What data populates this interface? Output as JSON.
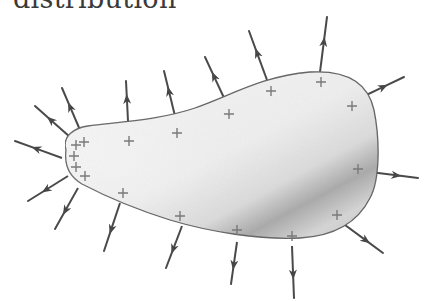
{
  "caption": {
    "text": "distribution"
  },
  "figure": {
    "colors": {
      "outline": "#555555",
      "arrow": "#4a4a4a",
      "plus": "#7a7a7a",
      "fill_light": "#f4f4f4",
      "fill_dark": "#9a9a9a"
    },
    "blob_path": "M 66 150 C 62 136, 74 128, 88 126 C 118 122, 160 120, 195 108 C 230 96, 262 76, 310 72 C 345 70, 368 82, 374 110 C 380 140, 380 180, 370 198 C 358 222, 335 236, 300 238 C 260 240, 210 232, 170 220 C 135 209, 105 196, 82 184 C 70 177, 64 166, 66 150 Z",
    "plus_signs": [
      [
        84,
        142
      ],
      [
        76,
        145
      ],
      [
        74,
        156
      ],
      [
        76,
        167
      ],
      [
        85,
        176
      ],
      [
        129,
        141
      ],
      [
        177,
        133
      ],
      [
        229,
        114
      ],
      [
        271,
        91
      ],
      [
        321,
        82
      ],
      [
        352,
        106
      ],
      [
        358,
        169
      ],
      [
        337,
        215
      ],
      [
        292,
        236
      ],
      [
        237,
        230
      ],
      [
        180,
        216
      ],
      [
        123,
        193
      ]
    ],
    "arrows": [
      [
        62,
        158,
        15,
        141
      ],
      [
        70,
        137,
        35,
        106
      ],
      [
        80,
        130,
        62,
        88
      ],
      [
        128,
        121,
        126,
        81
      ],
      [
        175,
        116,
        164,
        71
      ],
      [
        225,
        100,
        205,
        57
      ],
      [
        267,
        80,
        249,
        31
      ],
      [
        320,
        72,
        327,
        17
      ],
      [
        358,
        99,
        404,
        77
      ],
      [
        370,
        172,
        418,
        178
      ],
      [
        345,
        225,
        383,
        253
      ],
      [
        292,
        246,
        294,
        298
      ],
      [
        237,
        242,
        231,
        284
      ],
      [
        182,
        226,
        166,
        268
      ],
      [
        120,
        203,
        104,
        251
      ],
      [
        78,
        188,
        55,
        229
      ],
      [
        68,
        176,
        28,
        201
      ]
    ]
  }
}
